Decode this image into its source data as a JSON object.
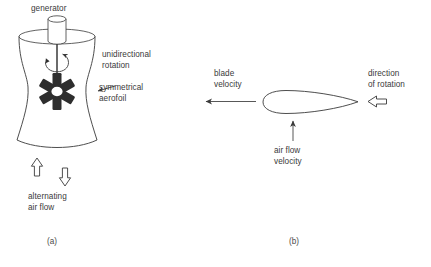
{
  "figure": {
    "panel_a": {
      "caption": "(a)",
      "labels": {
        "generator": "generator",
        "unidirectional_rotation": "unidirectional\nrotation",
        "symmetrical_aerofoil": "symmetrical\naerofoil",
        "alternating_air_flow": "alternating\nair flow"
      },
      "arrows": {
        "air_flow_up": "hollow-arrow-up-icon",
        "air_flow_down": "hollow-arrow-down-icon",
        "rotation_curved": "curved-rotation-arrow-icon",
        "aerofoil_pointer": "pointer-arrow-icon"
      },
      "blade_count": 6
    },
    "panel_b": {
      "caption": "(b)",
      "labels": {
        "blade_velocity": "blade\nvelocity",
        "air_flow_velocity": "air flow\nvelocity",
        "direction_of_rotation": "direction\nof rotation"
      },
      "arrows": {
        "blade_velocity": "thin-arrow-left-icon",
        "air_flow_velocity": "thin-arrow-up-icon",
        "direction_of_rotation": "hollow-arrow-left-icon"
      },
      "aerofoil_shape": "symmetrical-teardrop-aerofoil"
    }
  },
  "colors": {
    "line": "#3a3a3a",
    "blade_fill": "#2e2e2e",
    "text": "#3a3a3a",
    "background": "#ffffff"
  }
}
